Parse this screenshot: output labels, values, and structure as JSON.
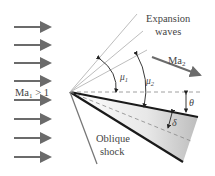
{
  "diagram": {
    "labels": {
      "expansion_line1": "Expansion",
      "expansion_line2": "waves",
      "mach_upstream": "Ma",
      "mach_upstream_sub": "1",
      "mach_upstream_cond": " > 1",
      "mach_downstream": "Ma",
      "mach_downstream_sub": "2",
      "mu1": "μ",
      "mu1_sub": "1",
      "mu2": "μ",
      "mu2_sub": "2",
      "theta": "θ",
      "delta": "δ",
      "oblique_line1": "Oblique",
      "oblique_line2": "shock"
    },
    "colors": {
      "arrow": "#6b6b6b",
      "wedge_edge": "#1a1a1a",
      "wave_line": "#b5b5b5",
      "dashed": "#888888",
      "text": "#444444"
    },
    "incoming_arrow_rows": 8
  }
}
